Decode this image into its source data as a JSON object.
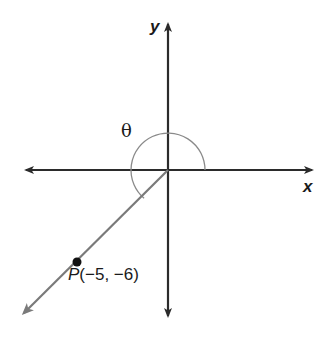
{
  "diagram": {
    "type": "coordinate-plane-angle",
    "axes": {
      "x_label": "x",
      "y_label": "y",
      "color": "#2b2b2b"
    },
    "angle": {
      "label": "θ",
      "description": "Angle in standard position measured counterclockwise from positive x-axis to terminal ray in quadrant III",
      "arc_color": "#8a8a8a"
    },
    "terminal_ray": {
      "color": "#7a7a7a",
      "direction": "quadrant III"
    },
    "point": {
      "name": "P",
      "coords": "(−5, −6)",
      "x": -5,
      "y": -6,
      "color": "#111111"
    }
  }
}
